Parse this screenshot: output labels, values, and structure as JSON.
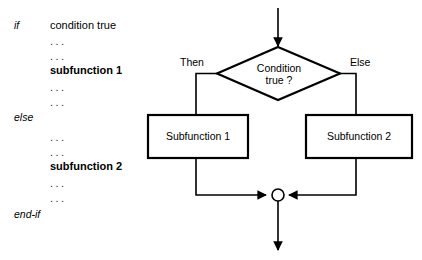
{
  "diagram": {
    "type": "flowchart",
    "pseudocode": {
      "lines": [
        {
          "keyword": "if",
          "text": "condition true",
          "style": "normal"
        },
        {
          "keyword": "",
          "text": "...",
          "style": "dots"
        },
        {
          "keyword": "",
          "text": "...",
          "style": "dots"
        },
        {
          "keyword": "",
          "text": "subfunction 1",
          "style": "bold"
        },
        {
          "keyword": "",
          "text": "...",
          "style": "dots"
        },
        {
          "keyword": "",
          "text": "...",
          "style": "dots"
        },
        {
          "keyword": "else",
          "text": "",
          "style": "normal"
        },
        {
          "keyword": "",
          "text": "...",
          "style": "dots"
        },
        {
          "keyword": "",
          "text": "...",
          "style": "dots"
        },
        {
          "keyword": "",
          "text": "subfunction 2",
          "style": "bold"
        },
        {
          "keyword": "",
          "text": "...",
          "style": "dots"
        },
        {
          "keyword": "",
          "text": "...",
          "style": "dots"
        },
        {
          "keyword": "end-if",
          "text": "",
          "style": "normal"
        }
      ],
      "keywords": {
        "if": "if",
        "else": "else",
        "end_if": "end-if"
      },
      "condition": "condition true",
      "subfunction_1": "subfunction 1",
      "subfunction_2": "subfunction 2",
      "ellipsis": "..."
    },
    "nodes": {
      "decision": {
        "shape": "diamond",
        "line1": "Condition",
        "line2": "true ?",
        "text": "Condition true ?"
      },
      "process_left": {
        "shape": "rectangle",
        "label": "Subfunction 1"
      },
      "process_right": {
        "shape": "rectangle",
        "label": "Subfunction 2"
      },
      "merge": {
        "shape": "circle",
        "label": ""
      }
    },
    "edge_labels": {
      "then": "Then",
      "else": "Else"
    },
    "colors": {
      "stroke": "#000000",
      "fill": "#ffffff",
      "text": "#000000"
    }
  }
}
